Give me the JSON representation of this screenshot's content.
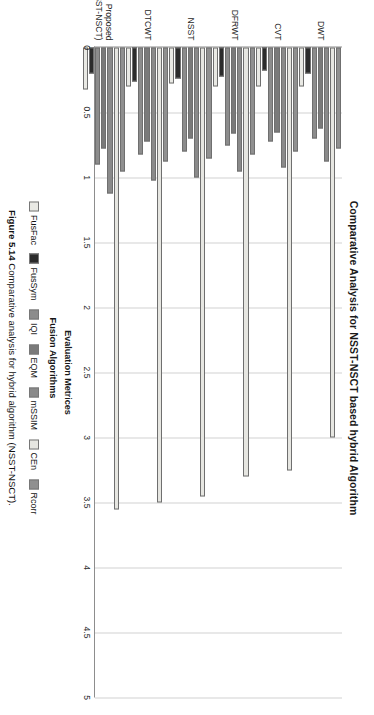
{
  "figure": {
    "title": "Comparative Analysis for NSST-NSCT based hybrid Algorithm",
    "caption_label": "Figure 5.14",
    "caption_text": "Comparative analysis for hybrid algorithm (NSST-NSCT)."
  },
  "chart_data": {
    "type": "bar",
    "orientation": "horizontal",
    "title": "Comparative Analysis for NSST-NSCT based hybrid Algorithm",
    "xlabel": "Fusion Algorithms",
    "ylabel": "Evaluation Metrices",
    "ylim": [
      0,
      5
    ],
    "ytick_labels": [
      "0",
      "0.5",
      "1",
      "1.5",
      "2",
      "2.5",
      "3",
      "3.5",
      "4",
      "4.5",
      "5"
    ],
    "ytick_values": [
      0,
      0.5,
      1,
      1.5,
      2,
      2.5,
      3,
      3.5,
      4,
      4.5,
      5
    ],
    "grid": true,
    "legend_position": "bottom",
    "categories": [
      "DWT",
      "CVT",
      "DFRWT",
      "NSST",
      "DTCWT",
      "Proposed (NSST-NSCT)"
    ],
    "category_lines": [
      [
        "DWT",
        ""
      ],
      [
        "CVT",
        ""
      ],
      [
        "DFRWT",
        ""
      ],
      [
        "NSST",
        ""
      ],
      [
        "DTCWT",
        ""
      ],
      [
        "Proposed",
        "(NSST-NSCT)"
      ]
    ],
    "series": [
      {
        "name": "FusFac",
        "color": "#e9e9e4",
        "values": [
          0.3,
          0.3,
          0.3,
          0.28,
          0.3,
          0.32
        ]
      },
      {
        "name": "FusSym",
        "color": "#2b2b2b",
        "values": [
          0.2,
          0.18,
          0.22,
          0.24,
          0.26,
          0.2
        ]
      },
      {
        "name": "IQI",
        "color": "#8c8c8c",
        "values": [
          0.7,
          0.72,
          0.75,
          0.8,
          0.82,
          0.9
        ]
      },
      {
        "name": "EQM",
        "color": "#7a7a7a",
        "values": [
          0.62,
          0.65,
          0.66,
          0.7,
          0.72,
          0.78
        ]
      },
      {
        "name": "mSSIM",
        "color": "#8a8a8a",
        "values": [
          0.88,
          0.92,
          0.95,
          1.0,
          1.02,
          1.12
        ]
      },
      {
        "name": "CEn",
        "color": "#e6e6e1",
        "values": [
          3.0,
          3.25,
          3.3,
          3.45,
          3.5,
          3.55
        ]
      },
      {
        "name": "Rcorr",
        "color": "#909090",
        "values": [
          0.78,
          0.8,
          0.82,
          0.85,
          0.88,
          0.95
        ]
      }
    ]
  }
}
